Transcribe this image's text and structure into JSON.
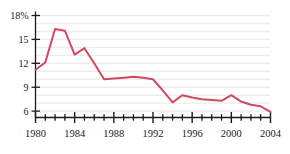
{
  "chart_data": {
    "type": "line",
    "title": "",
    "subtitle": "",
    "xlabel": "",
    "ylabel": "",
    "xlim": [
      1980,
      2004
    ],
    "ylim": [
      5.2,
      18
    ],
    "grid": true,
    "grid_step": 1,
    "legend": "none",
    "line_color": "#d0495f",
    "x": [
      1980,
      1981,
      1982,
      1983,
      1984,
      1985,
      1986,
      1987,
      1988,
      1989,
      1990,
      1991,
      1992,
      1993,
      1994,
      1995,
      1996,
      1997,
      1998,
      1999,
      2000,
      2001,
      2002,
      2003,
      2004
    ],
    "values": [
      11.2,
      12.1,
      16.3,
      16.1,
      13.1,
      13.9,
      12.0,
      10.0,
      10.1,
      10.2,
      10.3,
      10.2,
      10.0,
      8.6,
      7.1,
      8.0,
      7.7,
      7.5,
      7.4,
      7.3,
      8.0,
      7.2,
      6.8,
      6.6,
      5.9
    ],
    "y_ticks": [
      6,
      9,
      12,
      15,
      18
    ],
    "y_tick_labels": [
      "6",
      "9",
      "12",
      "15",
      "18%"
    ],
    "x_ticks": [
      1980,
      1984,
      1988,
      1992,
      1996,
      2000,
      2004
    ],
    "x_tick_labels": [
      "1980",
      "1984",
      "1988",
      "1992",
      "1996",
      "2000",
      "2004"
    ],
    "x_minor_ticks": [
      1981,
      1982,
      1983,
      1985,
      1986,
      1987,
      1989,
      1990,
      1991,
      1993,
      1994,
      1995,
      1997,
      1998,
      1999,
      2001,
      2002,
      2003
    ],
    "annotations": []
  },
  "axes": {
    "y_axis_name": "y-axis",
    "x_axis_name": "x-axis",
    "grid_color": "#ededed",
    "axis_color": "#1a1a1a"
  }
}
